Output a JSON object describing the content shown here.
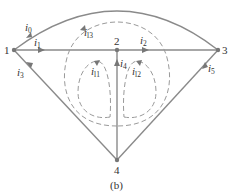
{
  "figure": {
    "caption": "(b)",
    "nodes": [
      {
        "id": "1",
        "label": "1"
      },
      {
        "id": "2",
        "label": "2"
      },
      {
        "id": "3",
        "label": "3"
      },
      {
        "id": "4",
        "label": "4"
      }
    ],
    "branch_currents": [
      {
        "name": "i0",
        "base": "i",
        "sub": "0",
        "from": "1",
        "to": "3",
        "path": "arc"
      },
      {
        "name": "i1",
        "base": "i",
        "sub": "1",
        "from": "1",
        "to": "2"
      },
      {
        "name": "i2",
        "base": "i",
        "sub": "2",
        "from": "2",
        "to": "3"
      },
      {
        "name": "i3",
        "base": "i",
        "sub": "3",
        "from": "4",
        "to": "1"
      },
      {
        "name": "i4",
        "base": "i",
        "sub": "4",
        "from": "4",
        "to": "2"
      },
      {
        "name": "i5",
        "base": "i",
        "sub": "5",
        "from": "4",
        "to": "3"
      }
    ],
    "loop_currents": [
      {
        "name": "il1",
        "base": "i",
        "sub": "l1"
      },
      {
        "name": "il2",
        "base": "i",
        "sub": "l2"
      },
      {
        "name": "il3",
        "base": "i",
        "sub": "l3"
      }
    ],
    "colors": {
      "wire": "#8a8a8a",
      "loop": "#9a9a9a",
      "node": "#777777"
    }
  }
}
